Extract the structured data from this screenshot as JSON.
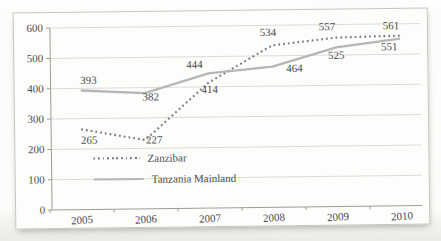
{
  "chart_data": {
    "type": "line",
    "x": [
      "2005",
      "2006",
      "2007",
      "2008",
      "2009",
      "2010"
    ],
    "series": [
      {
        "name": "Zanzibar",
        "values": [
          265,
          227,
          414,
          534,
          557,
          561
        ],
        "style": "dotted",
        "color": "#7b7b7b",
        "label_offsets": [
          [
            8,
            11
          ],
          [
            9,
            0
          ],
          [
            1,
            7
          ],
          [
            -4,
            -13
          ],
          [
            -9,
            -11
          ],
          [
            -9,
            -10
          ]
        ]
      },
      {
        "name": "Tanzania Mainland",
        "values": [
          393,
          382,
          444,
          464,
          525,
          551
        ],
        "style": "solid",
        "color": "#b6b6b6",
        "label_offsets": [
          [
            8,
            -10
          ],
          [
            6,
            4
          ],
          [
            -14,
            -9
          ],
          [
            22,
            2
          ],
          [
            0,
            8
          ],
          [
            -11,
            8
          ]
        ]
      }
    ],
    "title": "",
    "xlabel": "",
    "ylabel": "",
    "ylim": [
      0,
      600
    ],
    "ytick_step": 100,
    "yticklabels": [
      "0",
      "100",
      "200",
      "300",
      "400",
      "500",
      "600"
    ],
    "xticklabels": [
      "2005",
      "2006",
      "2007",
      "2008",
      "2009",
      "2010"
    ],
    "grid": true,
    "legend_position": "inside-bottom-left"
  },
  "colors": {
    "grid": "#dcdcd8",
    "axis": "#9c9c98",
    "tick_text": "#4c4c4c",
    "data_label_text": "#474747",
    "frame_border": "#c7c6c2",
    "page_background": "#fcfcfa"
  }
}
